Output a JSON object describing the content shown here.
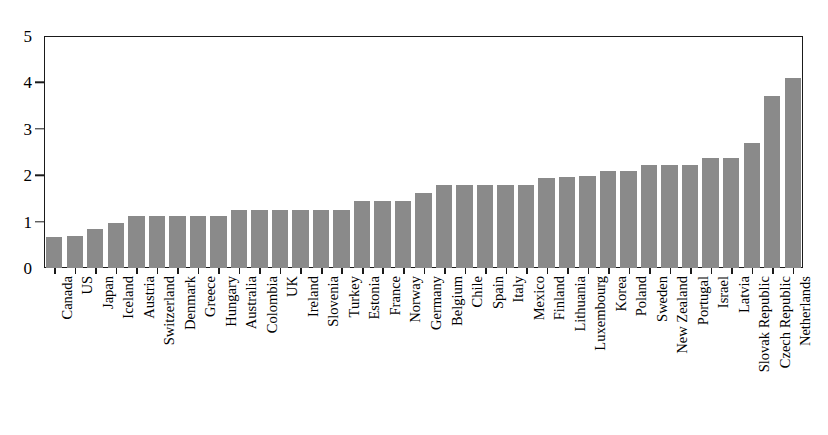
{
  "chart_data": {
    "type": "bar",
    "title": "",
    "subtitle": "",
    "xlabel": "",
    "ylabel": "",
    "ylim": [
      0,
      5
    ],
    "yticks": [
      0,
      1,
      2,
      3,
      4,
      5
    ],
    "ytick_labels": [
      "0",
      "1",
      "2",
      "3",
      "4",
      "5"
    ],
    "grid": false,
    "legend": null,
    "orientation": "vertical",
    "bar_color": "#8a8a8a",
    "axis_color": "#1a1a1a",
    "categories": [
      "Canada",
      "US",
      "Japan",
      "Iceland",
      "Austria",
      "Switzerland",
      "Denmark",
      "Greece",
      "Hungary",
      "Australia",
      "Colombia",
      "UK",
      "Ireland",
      "Slovenia",
      "Turkey",
      "Estonia",
      "France",
      "Norway",
      "Germany",
      "Belgium",
      "Chile",
      "Spain",
      "Italy",
      "Mexico",
      "Finland",
      "Lithuania",
      "Luxembourg",
      "Korea",
      "Poland",
      "Sweden",
      "New Zealand",
      "Portugal",
      "Israel",
      "Latvia",
      "Slovak Republic",
      "Czech Republic",
      "Netherlands"
    ],
    "values": [
      0.67,
      0.68,
      0.84,
      0.98,
      1.13,
      1.13,
      1.13,
      1.13,
      1.13,
      1.26,
      1.26,
      1.26,
      1.26,
      1.26,
      1.26,
      1.44,
      1.44,
      1.44,
      1.62,
      1.78,
      1.78,
      1.78,
      1.78,
      1.78,
      1.95,
      1.96,
      1.98,
      2.1,
      2.1,
      2.22,
      2.22,
      2.22,
      2.37,
      2.37,
      2.7,
      3.7,
      4.1
    ]
  }
}
